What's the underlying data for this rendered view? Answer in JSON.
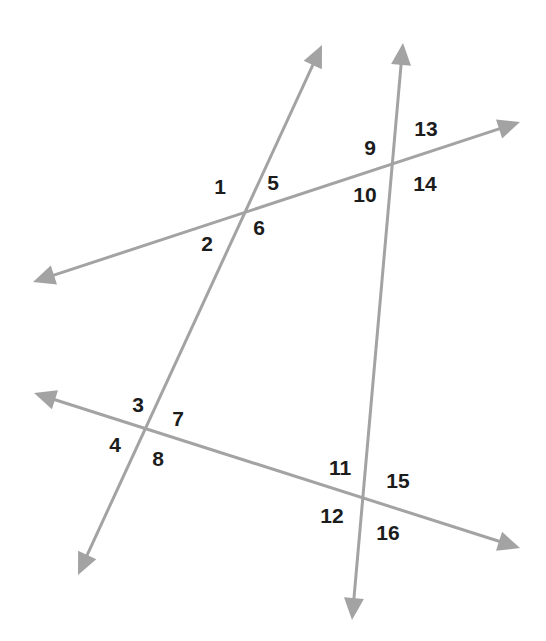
{
  "diagram": {
    "title": "",
    "colors": {
      "background": "#ffffff",
      "line": "#a3a3a3",
      "label": "#1c1c1c"
    },
    "lines": [
      {
        "id": "line-left-steep",
        "from": [
          78,
          575
        ],
        "to": [
          322,
          45
        ],
        "arrows": "both"
      },
      {
        "id": "line-right-steep",
        "from": [
          352,
          620
        ],
        "to": [
          403,
          43
        ],
        "arrows": "both"
      },
      {
        "id": "line-upper-transversal",
        "from": [
          33,
          282
        ],
        "to": [
          520,
          122
        ],
        "arrows": "both"
      },
      {
        "id": "line-lower-transversal",
        "from": [
          34,
          393
        ],
        "to": [
          520,
          548
        ],
        "arrows": "both"
      }
    ],
    "intersections": [
      {
        "id": "A",
        "point": [
          245,
          210
        ],
        "angles": [
          "1",
          "2",
          "5",
          "6"
        ]
      },
      {
        "id": "B",
        "point": [
          393,
          162
        ],
        "angles": [
          "9",
          "10",
          "13",
          "14"
        ]
      },
      {
        "id": "C",
        "point": [
          147,
          428
        ],
        "angles": [
          "3",
          "4",
          "7",
          "8"
        ]
      },
      {
        "id": "D",
        "point": [
          362,
          499
        ],
        "angles": [
          "11",
          "12",
          "15",
          "16"
        ]
      }
    ],
    "labels": [
      {
        "text": "1",
        "x": 220,
        "y": 186
      },
      {
        "text": "2",
        "x": 207,
        "y": 243
      },
      {
        "text": "3",
        "x": 138,
        "y": 404
      },
      {
        "text": "4",
        "x": 115,
        "y": 444
      },
      {
        "text": "5",
        "x": 273,
        "y": 182
      },
      {
        "text": "6",
        "x": 259,
        "y": 227
      },
      {
        "text": "7",
        "x": 178,
        "y": 418
      },
      {
        "text": "8",
        "x": 158,
        "y": 458
      },
      {
        "text": "9",
        "x": 370,
        "y": 147
      },
      {
        "text": "10",
        "x": 365,
        "y": 194
      },
      {
        "text": "11",
        "x": 340,
        "y": 467
      },
      {
        "text": "12",
        "x": 332,
        "y": 515
      },
      {
        "text": "13",
        "x": 426,
        "y": 128
      },
      {
        "text": "14",
        "x": 425,
        "y": 183
      },
      {
        "text": "15",
        "x": 398,
        "y": 480
      },
      {
        "text": "16",
        "x": 388,
        "y": 532
      }
    ]
  }
}
